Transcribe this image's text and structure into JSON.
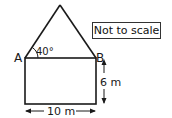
{
  "diagram": {
    "type": "geometry-figure",
    "note": "Not to scale",
    "labels": {
      "point_a": "A",
      "point_b": "B",
      "angle": "40°",
      "height": "6 m",
      "width": "10 m"
    },
    "colors": {
      "stroke": "#1a1a1a",
      "background": "#ffffff"
    }
  }
}
